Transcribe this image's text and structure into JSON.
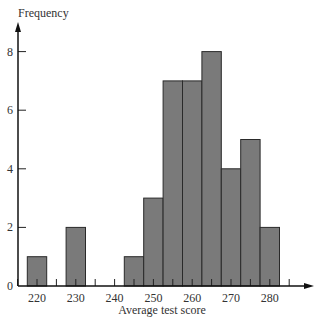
{
  "chart_data": {
    "type": "bar",
    "title": "",
    "xlabel": "Average test score",
    "ylabel": "Frequency",
    "bin_width": 5,
    "bins": [
      {
        "center": 220,
        "value": 1
      },
      {
        "center": 230,
        "value": 2
      },
      {
        "center": 245,
        "value": 1
      },
      {
        "center": 250,
        "value": 3
      },
      {
        "center": 255,
        "value": 7
      },
      {
        "center": 260,
        "value": 7
      },
      {
        "center": 265,
        "value": 8
      },
      {
        "center": 270,
        "value": 4
      },
      {
        "center": 275,
        "value": 5
      },
      {
        "center": 280,
        "value": 2
      }
    ],
    "categories": [
      220,
      230,
      245,
      250,
      255,
      260,
      265,
      270,
      275,
      280
    ],
    "values": [
      1,
      2,
      1,
      3,
      7,
      7,
      8,
      4,
      5,
      2
    ],
    "x_ticks_labeled": [
      220,
      230,
      240,
      250,
      260,
      270,
      280
    ],
    "x_ticks_minor": [
      215,
      220,
      225,
      230,
      235,
      240,
      245,
      250,
      255,
      260,
      265,
      270,
      275,
      280,
      285
    ],
    "y_ticks": [
      0,
      2,
      4,
      6,
      8
    ],
    "xlim": [
      212,
      290
    ],
    "ylim": [
      0,
      9
    ],
    "grid": false,
    "legend": null,
    "bar_color": "#7a7a7a",
    "bar_edge_color": "#2a2a2a"
  }
}
